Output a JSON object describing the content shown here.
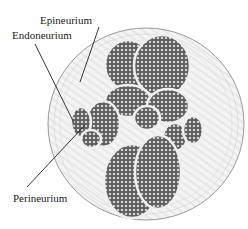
{
  "diagram": {
    "labels": {
      "epineurium": "Epineurium",
      "endoneurium": "Endoneurium",
      "perineurium": "Perineurium"
    },
    "colors": {
      "ink": "#222222",
      "fascicle_fill": "#6b6b6b",
      "sheath": "#d8d8d8",
      "background": "#ffffff"
    }
  }
}
